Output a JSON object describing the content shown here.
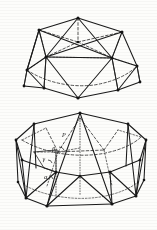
{
  "figure": {
    "background_color": "#fdfdfb",
    "ink_color": "#1a1a1a",
    "style": "scanned line drawing, solid visible edges, dashed hidden edges",
    "panels": [
      {
        "id": "upper",
        "name": "upper-polyhedron",
        "description": "Geodesic dome / gyroelongated cupola seen from above-front; heptagonal outline with apex vertex, triangulated faces, dashed hidden equatorial ring",
        "vertex_count": 15,
        "visible_edge_count": 34,
        "hidden_edge_count": 12
      },
      {
        "id": "lower",
        "name": "lower-polyhedron",
        "description": "Antiprism-like drum: upper and lower nonagonal rings joined by zig-zag triangles, dashed hidden back edges, dotted central axis, labelled angles",
        "vertex_count": 18,
        "visible_edge_count": 40,
        "hidden_edge_count": 14
      }
    ],
    "labels": [
      {
        "id": "p",
        "text": "P",
        "x": 62,
        "y": 136
      },
      {
        "id": "beta",
        "text": "β",
        "x": 52,
        "y": 150
      },
      {
        "id": "gamma",
        "text": "γ",
        "x": 43,
        "y": 160
      },
      {
        "id": "alpha",
        "text": "α",
        "x": 44,
        "y": 178
      }
    ]
  }
}
